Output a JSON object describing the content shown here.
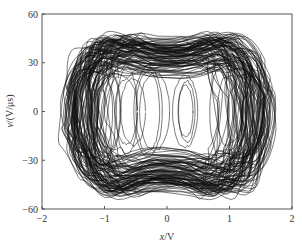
{
  "chart_data": {
    "type": "line",
    "subtype": "phase-portrait",
    "title": "",
    "xlabel": "x/V",
    "ylabel": "v/(V/μs)",
    "xlim": [
      -2,
      2
    ],
    "ylim": [
      -60,
      60
    ],
    "x_ticks": [
      -2,
      -1,
      0,
      1,
      2
    ],
    "x_tick_labels": [
      "−2",
      "−1",
      "0",
      "1",
      "2"
    ],
    "y_ticks": [
      -60,
      -30,
      0,
      30,
      60
    ],
    "y_tick_labels": [
      "−60",
      "−30",
      "0",
      "30",
      "60"
    ],
    "grid": false,
    "legend": null,
    "series": [
      {
        "name": "chaotic trajectory (x vs v)",
        "color": "#111111",
        "description": "Dense double-scroll-like chaotic attractor; trajectory fills a rounded rectangular band between x≈−1.6..1.6 and v≈−58..52, with a pinched waist near x=0 (v≈±42) and nested inner loops centered near x≈−1.0, −0.6, −0.2, 0.3, 0.9.",
        "extent": {
          "x_min": -1.62,
          "x_max": 1.62,
          "v_min": -57,
          "v_max": 52
        },
        "inner_loop_centers_x": [
          -1.0,
          -0.6,
          -0.25,
          0.3,
          0.9
        ]
      }
    ]
  },
  "labels": {
    "xlabel_var": "x",
    "xlabel_unit": "/V",
    "ylabel_var": "v",
    "ylabel_unit": "/(V/μs)"
  },
  "frame": {
    "left": 42,
    "top": 14,
    "right": 292,
    "bottom": 209,
    "color": "#555555"
  },
  "render": {
    "seed": 7,
    "loops": 95,
    "inner_loops": 14
  }
}
